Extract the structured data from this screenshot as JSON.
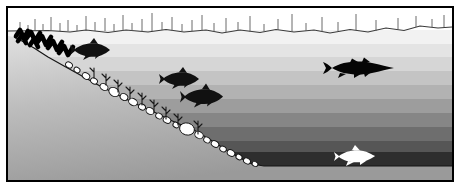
{
  "illustration": {
    "title": "Lake cross-section with thermal stratification and fish",
    "subject": "lake-profile-diagram",
    "alt": "Side-view cross section of a lake showing a sloping shoreline with reeds and rocks, layered water bands of increasing darkness with depth, several dark fish silhouettes in shallow water, a large pike in mid water, and a white fish near the bottom."
  },
  "frame": {
    "border_color": "#000000",
    "border_width_px": 2,
    "background": "#ffffff"
  },
  "sky": {
    "name": "sky-band",
    "color": "#ffffff",
    "top_px": 0,
    "height_px": 24
  },
  "surface": {
    "name": "water-surface-line",
    "color": "#3a3a3a",
    "y_px": 26,
    "label": "water surface"
  },
  "reeds": {
    "name": "emergent-reeds",
    "color": "#555555",
    "count": 34,
    "positions_px": [
      18,
      26,
      33,
      41,
      49,
      58,
      66,
      75,
      84,
      93,
      103,
      112,
      121,
      130,
      140,
      150,
      160,
      170,
      180,
      190,
      200,
      212,
      224,
      236,
      248,
      262,
      276,
      290,
      304,
      320,
      336,
      354,
      374,
      396
    ],
    "heights_px": [
      9,
      6,
      12,
      7,
      14,
      8,
      11,
      6,
      15,
      9,
      13,
      7,
      16,
      8,
      12,
      18,
      9,
      14,
      7,
      11,
      16,
      8,
      13,
      9,
      15,
      7,
      12,
      17,
      8,
      14,
      9,
      16,
      11,
      13
    ]
  },
  "water_layers": [
    {
      "name": "epilimnion-1",
      "label": "Epilimnion (warm surface layer)",
      "color": "#f2f2f2",
      "top_px": 28,
      "height_px": 14
    },
    {
      "name": "epilimnion-2",
      "label": "Epilimnion",
      "color": "#e4e4e4",
      "top_px": 42,
      "height_px": 13
    },
    {
      "name": "epilimnion-3",
      "label": "Epilimnion",
      "color": "#d6d6d6",
      "top_px": 55,
      "height_px": 14
    },
    {
      "name": "metalimnion-1",
      "label": "Metalimnion (thermocline)",
      "color": "#c4c4c4",
      "top_px": 69,
      "height_px": 14
    },
    {
      "name": "metalimnion-2",
      "label": "Metalimnion (thermocline)",
      "color": "#b2b2b2",
      "top_px": 83,
      "height_px": 14
    },
    {
      "name": "metalimnion-3",
      "label": "Metalimnion (thermocline)",
      "color": "#9d9d9d",
      "top_px": 97,
      "height_px": 14
    },
    {
      "name": "hypolimnion-1",
      "label": "Hypolimnion (cold deep layer)",
      "color": "#868686",
      "top_px": 111,
      "height_px": 14
    },
    {
      "name": "hypolimnion-2",
      "label": "Hypolimnion (cold deep layer)",
      "color": "#6e6e6e",
      "top_px": 125,
      "height_px": 14
    },
    {
      "name": "hypolimnion-3",
      "label": "Hypolimnion (cold deep layer)",
      "color": "#565656",
      "top_px": 139,
      "height_px": 11
    },
    {
      "name": "deep-zone",
      "label": "Deep bottom water",
      "color": "#2e2e2e",
      "top_px": 150,
      "height_px": 14
    }
  ],
  "lakebed": {
    "name": "sloping-lake-bed",
    "label": "Sloping shoreline and lake bed",
    "fill_top": "#dcdcdc",
    "fill_bottom": "#9a9a9a",
    "outline_color": "#1a1a1a",
    "floor_color": "#9f9f9f",
    "slope_start_px": [
      10,
      36
    ],
    "slope_end_px": [
      250,
      164
    ],
    "floor_y_px": 164
  },
  "rocks": {
    "name": "rock-chain",
    "label": "Rocks and cobbles along the drop-off",
    "fill": "#ffffff",
    "outline": "#111111",
    "count": 22
  },
  "shore_vegetation": {
    "name": "shore-scribble-vegetation",
    "label": "Dense shoreline vegetation",
    "color": "#000000",
    "strokes": 7
  },
  "submerged_weeds": {
    "name": "submerged-weeds",
    "label": "Submerged weed growth on slope",
    "color": "#1a1a1a",
    "count": 9
  },
  "fish": [
    {
      "name": "fish-shallow-upper",
      "species_label": "perch",
      "color": "#111111",
      "x_px": 68,
      "y_px": 40,
      "length_px": 40,
      "facing": "left",
      "depth_zone": "epilimnion-1"
    },
    {
      "name": "fish-midslope-upper",
      "species_label": "perch",
      "color": "#111111",
      "x_px": 157,
      "y_px": 69,
      "length_px": 40,
      "facing": "left",
      "depth_zone": "metalimnion-1"
    },
    {
      "name": "fish-midslope-lower",
      "species_label": "perch",
      "color": "#111111",
      "x_px": 178,
      "y_px": 86,
      "length_px": 43,
      "facing": "left",
      "depth_zone": "metalimnion-2"
    },
    {
      "name": "fish-pike-open-water",
      "species_label": "pike",
      "color": "#050505",
      "x_px": 316,
      "y_px": 56,
      "length_px": 76,
      "facing": "right",
      "depth_zone": "metalimnion-1"
    },
    {
      "name": "fish-deep-white",
      "species_label": "whitefish",
      "color": "#ffffff",
      "x_px": 328,
      "y_px": 146,
      "length_px": 48,
      "facing": "right",
      "depth_zone": "deep-zone"
    }
  ]
}
